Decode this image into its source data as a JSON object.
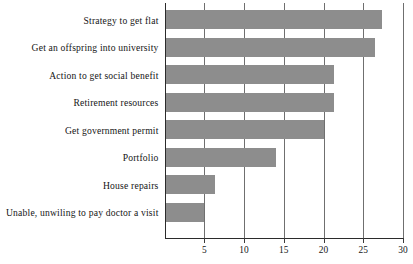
{
  "chart_data": {
    "type": "bar",
    "orientation": "horizontal",
    "title": "",
    "subtitle": "",
    "xlabel": "",
    "ylabel": "",
    "categories": [
      "Strategy to get flat",
      "Get an offspring into university",
      "Action to get social benefit",
      "Retirement resources",
      "Get government permit",
      "Portfolio",
      "House repairs",
      "Unable, unwiling to pay doctor a visit"
    ],
    "values": [
      27.4,
      26.5,
      21.3,
      21.3,
      20.0,
      14.0,
      6.3,
      5.0
    ],
    "xlim": [
      0,
      30
    ],
    "xticks": [
      5,
      10,
      15,
      20,
      25,
      30
    ],
    "xtick_labels": [
      "5",
      "10",
      "15",
      "20",
      "25",
      "30"
    ],
    "grid": true,
    "grid_axis": "x",
    "legend": false,
    "legend_position": "none",
    "bar_color": "#8d8d8d",
    "axis_color": "#2b2b2b",
    "grid_color": "#6f6f6f",
    "text_color": "#151515"
  }
}
